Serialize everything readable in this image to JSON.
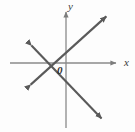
{
  "figure": {
    "title": "",
    "background_color": "#fdfdfd",
    "width": 135,
    "height": 132
  },
  "labels": {
    "y_axis": "y",
    "x_axis": "x",
    "origin": "0"
  },
  "colors": {
    "axis": "#8a8a8a",
    "line": "#5a5a5a",
    "label_text": "#3a3a3a",
    "origin_text": "#2f2f2f"
  },
  "chart_data": {
    "type": "line",
    "title": "",
    "xlabel": "x",
    "ylabel": "y",
    "grid": false,
    "legend": null,
    "axes": {
      "origin_px": [
        66,
        63
      ],
      "x_axis_px": {
        "x1": 10,
        "y1": 63,
        "x2": 118,
        "y2": 63,
        "arrow": "end"
      },
      "y_axis_px": {
        "x1": 66,
        "y1": 10,
        "x2": 66,
        "y2": 128,
        "arrow": "start"
      },
      "origin_label": "0",
      "tick_labels": []
    },
    "series": [
      {
        "name": "line-rising",
        "slope_sign": "positive",
        "arrows": "both",
        "points_px": [
          [
            27,
            88
          ],
          [
            110,
            13
          ]
        ]
      },
      {
        "name": "line-falling",
        "slope_sign": "negative",
        "arrows": "both",
        "points_px": [
          [
            28,
            42
          ],
          [
            105,
            122
          ]
        ]
      }
    ],
    "intersection_px": [
      49,
      63
    ],
    "annotations": [
      {
        "text": "y",
        "position_px": [
          70,
          6
        ]
      },
      {
        "text": "x",
        "position_px": [
          126,
          62
        ]
      },
      {
        "text": "0",
        "position_px": [
          59,
          70
        ]
      }
    ]
  }
}
